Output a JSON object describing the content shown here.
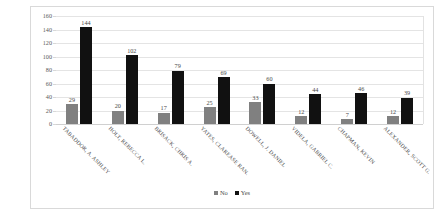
{
  "chart_data": {
    "type": "bar",
    "title": "",
    "subtitle": "",
    "xlabel": "",
    "ylabel": "",
    "ylim": [
      0,
      160
    ],
    "ytick_step": 20,
    "yticks": [
      "160",
      "140",
      "120",
      "100",
      "80",
      "60",
      "40",
      "20",
      "0"
    ],
    "grid": true,
    "legend_position": "bottom",
    "categories": [
      "TABADDOR, A. ASHLEY",
      "HOLT, REBECCA L.",
      "BRISACK, CHRIS A.",
      "YATES, CLAREASE RAN.",
      "DOWELL, J. DANIEL",
      "VIDELA, GABRIEL C.",
      "CHAPMAN, KEVIN",
      "ALEXANDER, SCOTT G."
    ],
    "series": [
      {
        "name": "No",
        "color": "#808080",
        "values": [
          29,
          20,
          17,
          25,
          33,
          12,
          7,
          12
        ]
      },
      {
        "name": "Yes",
        "color": "#111111",
        "values": [
          144,
          102,
          79,
          69,
          60,
          44,
          46,
          39
        ]
      }
    ]
  },
  "legend": {
    "items": [
      {
        "label": "No"
      },
      {
        "label": "Yes"
      }
    ]
  },
  "colors": {
    "no": "#808080",
    "yes": "#111111",
    "gridline": "#e4e4e4",
    "frame_border": "#d9d9d9",
    "text": "#4a4a4a"
  }
}
